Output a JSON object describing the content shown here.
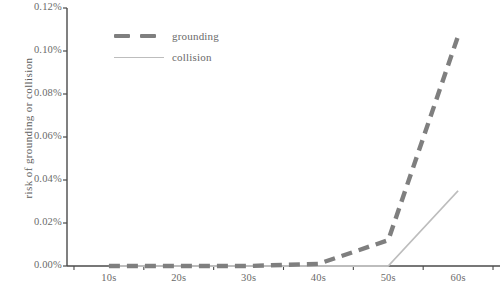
{
  "chart_data": {
    "type": "line",
    "title": "",
    "xlabel": "",
    "ylabel": "risk of grounding or collision",
    "grid": false,
    "legend_position": "top-left",
    "x": [
      "10s",
      "20s",
      "30s",
      "40s",
      "50s",
      "60s"
    ],
    "xtick_labels": [
      "10s",
      "20s",
      "30s",
      "40s",
      "50s",
      "60s"
    ],
    "ytick_labels": [
      "0.00%",
      "0.02%",
      "0.04%",
      "0.06%",
      "0.08%",
      "0.10%",
      "0.12%"
    ],
    "ylim": [
      0,
      0.12
    ],
    "ytick_values": [
      0.0,
      0.02,
      0.04,
      0.06,
      0.08,
      0.1,
      0.12
    ],
    "yunit": "%",
    "series": [
      {
        "name": "grounding",
        "style": "dashed",
        "color": "#7f7f7f",
        "values": [
          0.0,
          0.0,
          0.0,
          0.001,
          0.012,
          0.107
        ]
      },
      {
        "name": "collision",
        "style": "solid",
        "color": "#bdbdbd",
        "values": [
          0.0,
          0.0,
          0.0,
          0.0,
          0.0,
          0.035
        ]
      }
    ]
  },
  "legend": {
    "items": [
      {
        "label": "grounding",
        "style": "dashed",
        "color": "#7f7f7f"
      },
      {
        "label": "collision",
        "style": "solid",
        "color": "#bdbdbd"
      }
    ]
  },
  "axes": {
    "y_title": "risk of grounding or collision",
    "y_labels": [
      "0.12%",
      "0.10%",
      "0.08%",
      "0.06%",
      "0.04%",
      "0.02%",
      "0.00%"
    ],
    "x_labels": [
      "10s",
      "20s",
      "30s",
      "40s",
      "50s",
      "60s"
    ],
    "axis_color": "#4a4a4a"
  }
}
